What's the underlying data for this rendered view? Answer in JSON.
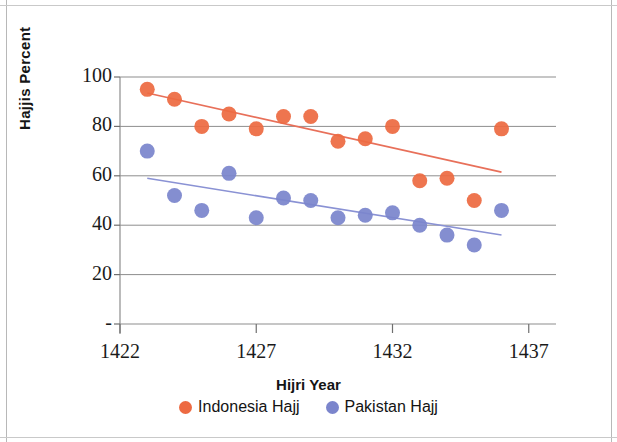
{
  "chart_data": {
    "type": "scatter",
    "title": "",
    "xlabel": "Hijri Year",
    "ylabel": "Hajjis Percent",
    "xlim": [
      1422,
      1438
    ],
    "ylim": [
      0,
      100
    ],
    "xticks": [
      "1422",
      "1427",
      "1432",
      "1437"
    ],
    "xtick_values": [
      1422,
      1427,
      1432,
      1437
    ],
    "yticks": [
      "-",
      "20",
      "40",
      "60",
      "80",
      "100"
    ],
    "ytick_values": [
      0,
      20,
      40,
      60,
      80,
      100
    ],
    "grid": true,
    "legend_position": "bottom",
    "series": [
      {
        "name": "Indonesia Hajj",
        "color": "#ED6A42",
        "marker": "circle",
        "x": [
          1423,
          1424,
          1425,
          1426,
          1427,
          1428,
          1429,
          1430,
          1431,
          1432,
          1433,
          1434,
          1435,
          1436
        ],
        "values": [
          95,
          91,
          80,
          85,
          79,
          84,
          84,
          74,
          75,
          80,
          58,
          59,
          50,
          79
        ],
        "trendline": {
          "x_start": 1423,
          "y_start": 93.5,
          "x_end": 1436,
          "y_end": 61.5,
          "color": "#E8705A"
        }
      },
      {
        "name": "Pakistan Hajj",
        "color": "#7B85CC",
        "marker": "circle",
        "x": [
          1423,
          1424,
          1425,
          1426,
          1427,
          1428,
          1429,
          1430,
          1431,
          1432,
          1433,
          1434,
          1435,
          1436
        ],
        "values": [
          70,
          52,
          46,
          61,
          43,
          51,
          50,
          43,
          44,
          45,
          40,
          36,
          32,
          46
        ],
        "trendline": {
          "x_start": 1423,
          "y_start": 59,
          "x_end": 1436,
          "y_end": 36,
          "color": "#8A92D4"
        }
      }
    ]
  },
  "axis": {
    "y_title": "Hajjis Percent",
    "x_title": "Hijri Year"
  },
  "legend": {
    "items": [
      {
        "label": "Indonesia Hajj",
        "color": "#ED6A42"
      },
      {
        "label": "Pakistan Hajj",
        "color": "#7B85CC"
      }
    ]
  }
}
